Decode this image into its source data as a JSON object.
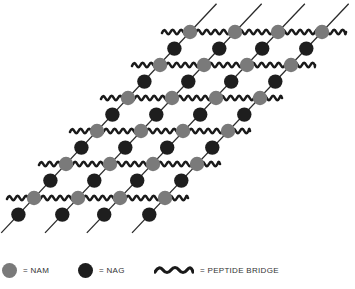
{
  "figure": {
    "colors": {
      "nam": "#7a7a7a",
      "nag": "#1e1e1e",
      "strand": "#2a2a2a",
      "bridge": "#1a1a1a"
    },
    "nam_rows": [
      {
        "y": 32,
        "x": [
          190,
          235,
          278,
          322
        ]
      },
      {
        "y": 65,
        "x": [
          160,
          204,
          247,
          291
        ]
      },
      {
        "y": 98,
        "x": [
          128,
          172,
          216,
          260
        ]
      },
      {
        "y": 131,
        "x": [
          97,
          141,
          183,
          228
        ]
      },
      {
        "y": 164,
        "x": [
          66,
          110,
          153,
          197
        ]
      },
      {
        "y": 198,
        "x": [
          34,
          78,
          120,
          165
        ]
      }
    ],
    "bridge_rows": [
      {
        "y": 32,
        "x_start": 162,
        "x_end": 346
      },
      {
        "y": 65,
        "x_start": 132,
        "x_end": 315
      },
      {
        "y": 98,
        "x_start": 101,
        "x_end": 282
      },
      {
        "y": 131,
        "x_start": 70,
        "x_end": 250
      },
      {
        "y": 164,
        "x_start": 39,
        "x_end": 220
      },
      {
        "y": 198,
        "x_start": 7,
        "x_end": 188
      }
    ]
  },
  "legend": {
    "items": [
      {
        "symbol": "nam-circle",
        "label": "= NAM"
      },
      {
        "symbol": "nag-circle",
        "label": "= NAG"
      },
      {
        "symbol": "wavy-line",
        "label": "= PEPTIDE BRIDGE"
      }
    ]
  }
}
